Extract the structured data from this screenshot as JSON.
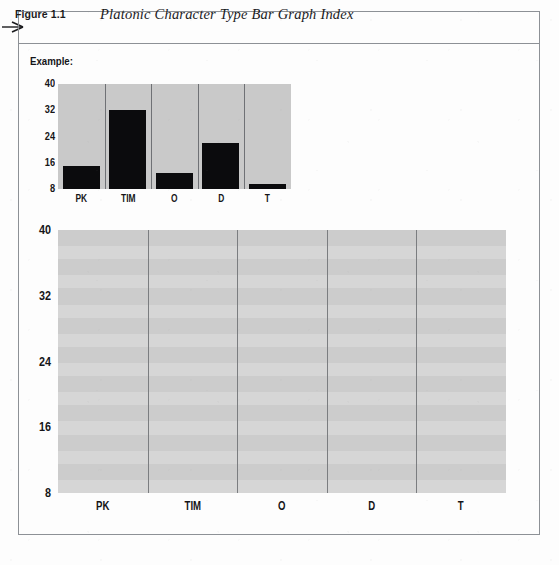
{
  "figure": {
    "number_label": "Figure 1.1",
    "number_prefix": "Figure",
    "number_value": "1.1",
    "title": "Platonic Character Type Bar Graph Index",
    "pointer_icon": "right-arrow-icon",
    "example_label": "Example:"
  },
  "chart_data": [
    {
      "name": "example-chart",
      "type": "bar",
      "title": "Example:",
      "xlabel": "",
      "ylabel": "",
      "categories": [
        "PK",
        "TIM",
        "O",
        "D",
        "T"
      ],
      "values": [
        15,
        32,
        13,
        22,
        9.5
      ],
      "yticks": [
        "40",
        "32",
        "24",
        "16",
        "8"
      ],
      "ytick_values": [
        40,
        32,
        24,
        16,
        8
      ],
      "ylim": [
        8,
        40
      ],
      "grid": "vertical-dividers-only",
      "legend": "none",
      "bar_color": "#0b0b0d",
      "plot_background": "#c9c9c9"
    },
    {
      "name": "main-chart",
      "type": "bar",
      "title": "",
      "xlabel": "",
      "ylabel": "",
      "categories": [
        "PK",
        "TIM",
        "O",
        "D",
        "T"
      ],
      "values": [
        null,
        null,
        null,
        null,
        null
      ],
      "yticks": [
        "40",
        "32",
        "24",
        "16",
        "8"
      ],
      "ytick_values": [
        40,
        32,
        24,
        16,
        8
      ],
      "ylim": [
        8,
        40
      ],
      "grid": "vertical-dividers-only",
      "legend": "none",
      "bar_color": "#0b0b0d",
      "plot_background": "#d6d6d6",
      "note": "blank worksheet grid, no bars drawn"
    }
  ],
  "colors": {
    "frame_border": "#8d9196",
    "example_plot_bg": "#c9c9c9",
    "main_plot_bg": "#d6d6d6",
    "bar_fill": "#0b0b0d",
    "divider": "#6f7175",
    "text": "#151518",
    "page_bg": "#fdfdfd"
  }
}
